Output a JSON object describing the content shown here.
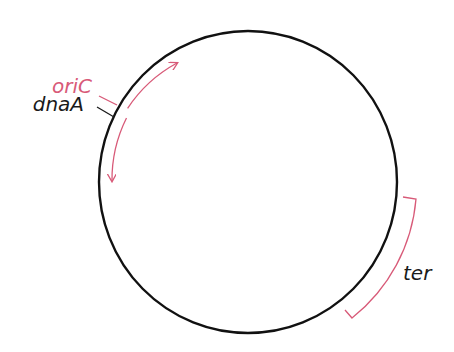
{
  "diagram": {
    "type": "bacterial-circular-chromosome",
    "colors": {
      "chromosome": "#111111",
      "highlight": "#d85a78",
      "text_dark": "#1a1a1a",
      "background": "#ffffff"
    },
    "labels": {
      "origin": "oriC",
      "gene": "dnaA",
      "terminus": "ter"
    }
  }
}
